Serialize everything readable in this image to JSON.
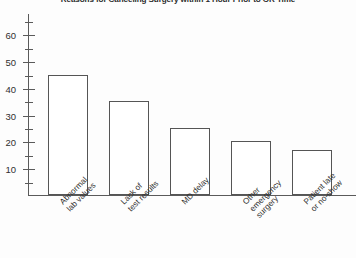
{
  "chart_data": {
    "type": "bar",
    "title": "Reasons for Canceling Surgery within 1 Hour Prior to OR Time",
    "xlabel": "",
    "ylabel": "",
    "categories": [
      "Abnormal lab values",
      "Lack of test results",
      "MD delay",
      "Other emergency surgery",
      "Patient late or no-show"
    ],
    "category_lines": [
      [
        "Abnormal",
        "lab values"
      ],
      [
        "Lack of",
        "test results"
      ],
      [
        "MD delay"
      ],
      [
        "Other",
        "emergency",
        "surgery"
      ],
      [
        "Patient late",
        "or no-show"
      ]
    ],
    "values": [
      45,
      35,
      25,
      20,
      17
    ],
    "ylim": [
      0,
      68
    ],
    "y_major_ticks": [
      10,
      20,
      30,
      40,
      50,
      60
    ],
    "y_minor_ticks": [
      5,
      15,
      25,
      35,
      45,
      55,
      65
    ],
    "y_tick_labels": [
      "10",
      "20",
      "30",
      "40",
      "50",
      "60"
    ],
    "grid": false,
    "legend": false,
    "bar_fill": "#ffffff",
    "bar_stroke": "#555555",
    "axis_color": "#5a5a5a",
    "text_color": "#2f2f2f",
    "background": "#fdfdfd"
  }
}
